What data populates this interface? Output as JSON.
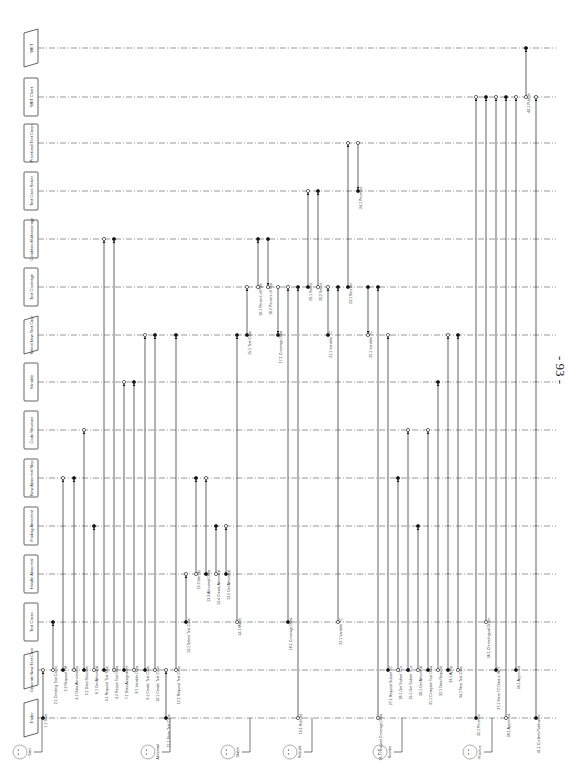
{
  "page": {
    "number": "- 93 -",
    "orientation": "rotated-90-ccw",
    "background": "#ffffff",
    "line_color": "#222222",
    "lifeline_color": "#555555"
  },
  "lifelines": [
    {
      "id": "trader",
      "label": "Trader",
      "shape": "parallelogram",
      "y": 718
    },
    {
      "id": "generate-test-case",
      "label": "Generate New Test Case",
      "shape": "parallelogram",
      "y": 670
    },
    {
      "id": "test-cases",
      "label": "Test Cases",
      "shape": "rect",
      "y": 622
    },
    {
      "id": "handle-abnormal",
      "label": "Handle Abnormal",
      "shape": "rect",
      "y": 574
    },
    {
      "id": "finding-abnormal",
      "label": "Finding Abnormal",
      "shape": "rect",
      "y": 526
    },
    {
      "id": "new-abnormal-step",
      "label": "New Abnormal Step",
      "shape": "rect",
      "y": 478
    },
    {
      "id": "code-structure",
      "label": "Code Structure",
      "shape": "rect",
      "y": 430
    },
    {
      "id": "variable",
      "label": "Variable",
      "shape": "rect",
      "y": 382
    },
    {
      "id": "select-new-test-case",
      "label": "Select New Test Case",
      "shape": "parallelogram",
      "y": 335
    },
    {
      "id": "test-coverage",
      "label": "Test Coverage",
      "shape": "rect",
      "y": 287
    },
    {
      "id": "condition-multicoverage",
      "label": "Condition Multicoverage",
      "shape": "rect",
      "y": 239
    },
    {
      "id": "test-case-solver",
      "label": "Test Case Solver",
      "shape": "rect",
      "y": 191
    },
    {
      "id": "prioritized-test-cases",
      "label": "Prioritized Test Cases",
      "shape": "rect",
      "y": 143
    },
    {
      "id": "wet-chart",
      "label": "WET Chart",
      "shape": "rect",
      "y": 97
    },
    {
      "id": "wet",
      "label": "WET",
      "shape": "parallelogram",
      "y": 48
    }
  ],
  "actors": [
    {
      "label": "Start",
      "x": 20
    },
    {
      "label": "Abnormal",
      "x": 148
    },
    {
      "label": "Match",
      "x": 228
    },
    {
      "label": "Rebuild",
      "x": 290
    },
    {
      "label": "Reorder",
      "x": 380
    },
    {
      "label": "Prioritize",
      "x": 470
    }
  ],
  "messages": [
    {
      "label": "1.1 Start",
      "x": 43,
      "from": "trader",
      "to": "generate-test-case"
    },
    {
      "label": "2.1 Creating Test Cases",
      "x": 53,
      "from": "generate-test-case",
      "to": "test-cases"
    },
    {
      "label": "2.2 Request TM",
      "x": 63,
      "from": "generate-test-case",
      "to": "new-abnormal-step"
    },
    {
      "label": "4.1 Data Abnormality",
      "x": 74,
      "from": "generate-test-case",
      "to": "new-abnormal-step"
    },
    {
      "label": "5.1 Data Structure",
      "x": 84,
      "from": "generate-test-case",
      "to": "code-structure"
    },
    {
      "label": "6.1 Get Abnormal",
      "x": 94,
      "from": "generate-test-case",
      "to": "finding-abnormal"
    },
    {
      "label": "3.1 Request Test Step",
      "x": 104,
      "from": "generate-test-case",
      "to": "condition-multicoverage"
    },
    {
      "label": "3.2 Return Test Data",
      "x": 114,
      "from": "generate-test-case",
      "to": "condition-multicoverage"
    },
    {
      "label": "7.1 Data Assignment",
      "x": 124,
      "from": "generate-test-case",
      "to": "variable"
    },
    {
      "label": "8.1 Variable Data",
      "x": 134,
      "from": "generate-test-case",
      "to": "variable"
    },
    {
      "label": "9.1 Create Test Case",
      "x": 145,
      "from": "generate-test-case",
      "to": "select-new-test-case"
    },
    {
      "label": "10.1 Create Test Case",
      "x": 155,
      "from": "generate-test-case",
      "to": "select-new-test-case"
    },
    {
      "label": "11.1 Store Test Case",
      "x": 166,
      "from": "trader",
      "to": "generate-test-case"
    },
    {
      "label": "12.1 Request Test Case",
      "x": 176,
      "from": "generate-test-case",
      "to": "select-new-test-case"
    },
    {
      "label": "13.1 Select Test Case",
      "x": 186,
      "from": "test-cases",
      "to": "handle-abnormal"
    },
    {
      "label": "13.2 Identify",
      "x": 196,
      "from": "handle-abnormal",
      "to": "new-abnormal-step"
    },
    {
      "label": "13.3 Abnormal Data",
      "x": 206,
      "from": "handle-abnormal",
      "to": "new-abnormal-step"
    },
    {
      "label": "13.4 Create Abnormal",
      "x": 216,
      "from": "handle-abnormal",
      "to": "finding-abnormal"
    },
    {
      "label": "13.5 Get Abnormal",
      "x": 226,
      "from": "handle-abnormal",
      "to": "finding-abnormal"
    },
    {
      "label": "14.1 Match",
      "x": 237,
      "from": "test-cases",
      "to": "select-new-test-case"
    },
    {
      "label": "15.1 Test Case",
      "x": 247,
      "from": "select-new-test-case",
      "to": "test-coverage"
    },
    {
      "label": "16.1 Percent of Path",
      "x": 258,
      "from": "test-coverage",
      "to": "condition-multicoverage"
    },
    {
      "label": "16.2 Percent of Test",
      "x": 268,
      "from": "condition-multicoverage",
      "to": "test-coverage"
    },
    {
      "label": "17.1 Coverage Data",
      "x": 278,
      "from": "test-coverage",
      "to": "select-new-test-case"
    },
    {
      "label": "18.1 Coverage Data",
      "x": 288,
      "from": "test-cases",
      "to": "test-coverage"
    },
    {
      "label": "19.1 Rebuild",
      "x": 298,
      "from": "trader",
      "to": "test-coverage"
    },
    {
      "label": "20.1 Select",
      "x": 308,
      "from": "test-coverage",
      "to": "test-case-solver"
    },
    {
      "label": "20.2 Select",
      "x": 318,
      "from": "test-coverage",
      "to": "test-case-solver"
    },
    {
      "label": "21.1 Variable TC",
      "x": 328,
      "from": "select-new-test-case",
      "to": "test-coverage"
    },
    {
      "label": "22.1 Variable TC",
      "x": 338,
      "from": "test-cases",
      "to": "test-coverage"
    },
    {
      "label": "23.1 Reorder",
      "x": 348,
      "from": "test-coverage",
      "to": "prioritized-test-cases"
    },
    {
      "label": "24.1 Priorities",
      "x": 358,
      "from": "prioritized-test-cases",
      "to": "test-case-solver"
    },
    {
      "label": "25.1 Variable TC",
      "x": 368,
      "from": "test-coverage",
      "to": "select-new-test-case"
    },
    {
      "label": "26.1 Request Coverage Data",
      "x": 378,
      "from": "trader",
      "to": "test-coverage"
    },
    {
      "label": "27.1 Request Subset TC",
      "x": 388,
      "from": "generate-test-case",
      "to": "select-new-test-case"
    },
    {
      "label": "28.1 Get Subset TCs",
      "x": 398,
      "from": "generate-test-case",
      "to": "new-abnormal-step"
    },
    {
      "label": "29.1 Get Subset TCs",
      "x": 408,
      "from": "generate-test-case",
      "to": "code-structure"
    },
    {
      "label": "30.1 Get Abnormal",
      "x": 418,
      "from": "generate-test-case",
      "to": "finding-abnormal"
    },
    {
      "label": "31.1 Compare Test Data",
      "x": 428,
      "from": "generate-test-case",
      "to": "code-structure"
    },
    {
      "label": "32.1 Data Request",
      "x": 438,
      "from": "generate-test-case",
      "to": "variable"
    },
    {
      "label": "33.1 Apply",
      "x": 448,
      "from": "generate-test-case",
      "to": "select-new-test-case"
    },
    {
      "label": "34.1 New Test Case",
      "x": 458,
      "from": "generate-test-case",
      "to": "select-new-test-case"
    },
    {
      "label": "35.1 Prioritize",
      "x": 476,
      "from": "trader",
      "to": "wet-chart"
    },
    {
      "label": "36.1 Chronological Order",
      "x": 486,
      "from": "test-cases",
      "to": "wet-chart"
    },
    {
      "label": "37.1 Store TC Data in WET",
      "x": 496,
      "from": "generate-test-case",
      "to": "wet-chart"
    },
    {
      "label": "38.1 Approved",
      "x": 506,
      "from": "trader",
      "to": "wet-chart"
    },
    {
      "label": "39.1 Approved",
      "x": 516,
      "from": "generate-test-case",
      "to": "wet-chart"
    },
    {
      "label": "40.1 Publish",
      "x": 526,
      "from": "wet-chart",
      "to": "wet"
    },
    {
      "label": "41.1 Confirm Publication",
      "x": 536,
      "from": "trader",
      "to": "wet-chart"
    }
  ]
}
